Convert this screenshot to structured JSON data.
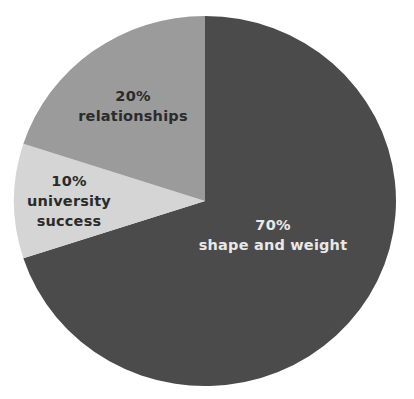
{
  "chart_data": {
    "type": "pie",
    "title": "",
    "start_angle_deg": 0,
    "direction": "clockwise",
    "center": [
      205,
      201
    ],
    "radius": [
      191,
      185
    ],
    "slices": [
      {
        "label": "shape and weight",
        "value": 70,
        "value_label": "70%",
        "color": "#4b4b4b",
        "text_color": "#e8e8e8",
        "label_pos": [
          273,
          215
        ]
      },
      {
        "label": "university success",
        "value": 10,
        "value_label": "10%",
        "color": "#d5d5d5",
        "text_color": "#2b2b2b",
        "label_pos": [
          69,
          171
        ],
        "label_lines": [
          "university",
          "success"
        ]
      },
      {
        "label": "relationships",
        "value": 20,
        "value_label": "20%",
        "color": "#9b9b9b",
        "text_color": "#2b2b2b",
        "label_pos": [
          133,
          86
        ]
      }
    ],
    "legend": null
  },
  "labels": {
    "shape": {
      "pct": "70%",
      "line1": "shape and weight"
    },
    "university": {
      "pct": "10%",
      "line1": "university",
      "line2": "success"
    },
    "relationships": {
      "pct": "20%",
      "line1": "relationships"
    }
  }
}
